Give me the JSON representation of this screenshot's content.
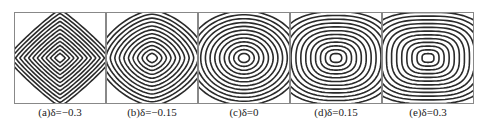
{
  "figure": {
    "line_color": "#2a2a2a",
    "border_color": "#888888",
    "panels": [
      {
        "label": "(a)δ=−0.3",
        "delta": -0.3
      },
      {
        "label": "(b)δ=−0.15",
        "delta": -0.15
      },
      {
        "label": "(c)δ=0",
        "delta": 0
      },
      {
        "label": "(d)δ=0.15",
        "delta": 0.15
      },
      {
        "label": "(e)δ=0.3",
        "delta": 0.3
      }
    ]
  }
}
